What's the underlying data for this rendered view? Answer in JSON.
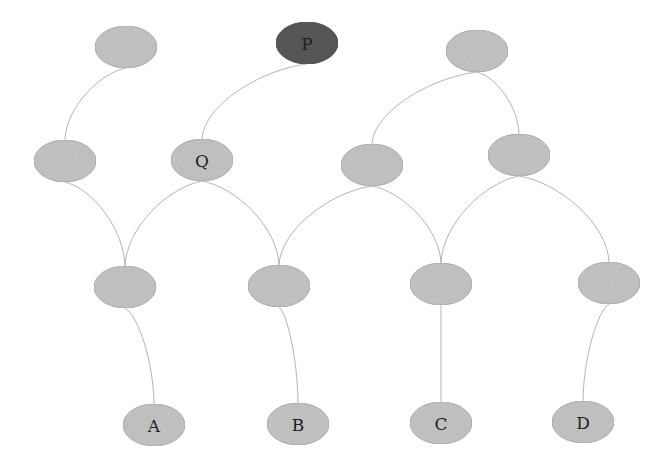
{
  "diagram": {
    "type": "layered-graph",
    "colors": {
      "node_default": "#c8c8c8",
      "node_highlight": "#5a5a5a",
      "node_stroke": "#a8a8a8",
      "edge": "#b4b4b4",
      "label": "#1e1e1e"
    },
    "nodes": [
      {
        "id": "n1",
        "label": "",
        "cx": 126,
        "cy": 47,
        "highlight": false
      },
      {
        "id": "P",
        "label": "P",
        "cx": 307,
        "cy": 43,
        "highlight": true
      },
      {
        "id": "n3",
        "label": "",
        "cx": 477,
        "cy": 51,
        "highlight": false
      },
      {
        "id": "n4",
        "label": "",
        "cx": 65,
        "cy": 161,
        "highlight": false
      },
      {
        "id": "Q",
        "label": "Q",
        "cx": 202,
        "cy": 160,
        "highlight": false
      },
      {
        "id": "n6",
        "label": "",
        "cx": 372,
        "cy": 165,
        "highlight": false
      },
      {
        "id": "n7",
        "label": "",
        "cx": 519,
        "cy": 155,
        "highlight": false
      },
      {
        "id": "n8",
        "label": "",
        "cx": 125,
        "cy": 287,
        "highlight": false
      },
      {
        "id": "n9",
        "label": "",
        "cx": 279,
        "cy": 286,
        "highlight": false
      },
      {
        "id": "n10",
        "label": "",
        "cx": 441,
        "cy": 284,
        "highlight": false
      },
      {
        "id": "n11",
        "label": "",
        "cx": 609,
        "cy": 283,
        "highlight": false
      },
      {
        "id": "A",
        "label": "A",
        "cx": 154,
        "cy": 425,
        "highlight": false
      },
      {
        "id": "B",
        "label": "B",
        "cx": 298,
        "cy": 424,
        "highlight": false
      },
      {
        "id": "C",
        "label": "C",
        "cx": 441,
        "cy": 423,
        "highlight": false
      },
      {
        "id": "D",
        "label": "D",
        "cx": 583,
        "cy": 422,
        "highlight": false
      }
    ],
    "edges": [
      {
        "from": "n1",
        "to": "n4"
      },
      {
        "from": "P",
        "to": "Q"
      },
      {
        "from": "n3",
        "to": "n6"
      },
      {
        "from": "n3",
        "to": "n7"
      },
      {
        "from": "n4",
        "to": "n8"
      },
      {
        "from": "Q",
        "to": "n8"
      },
      {
        "from": "Q",
        "to": "n9"
      },
      {
        "from": "n6",
        "to": "n9"
      },
      {
        "from": "n6",
        "to": "n10"
      },
      {
        "from": "n7",
        "to": "n10"
      },
      {
        "from": "n7",
        "to": "n11"
      },
      {
        "from": "n8",
        "to": "A"
      },
      {
        "from": "n9",
        "to": "B"
      },
      {
        "from": "n10",
        "to": "C"
      },
      {
        "from": "n11",
        "to": "D"
      }
    ]
  }
}
